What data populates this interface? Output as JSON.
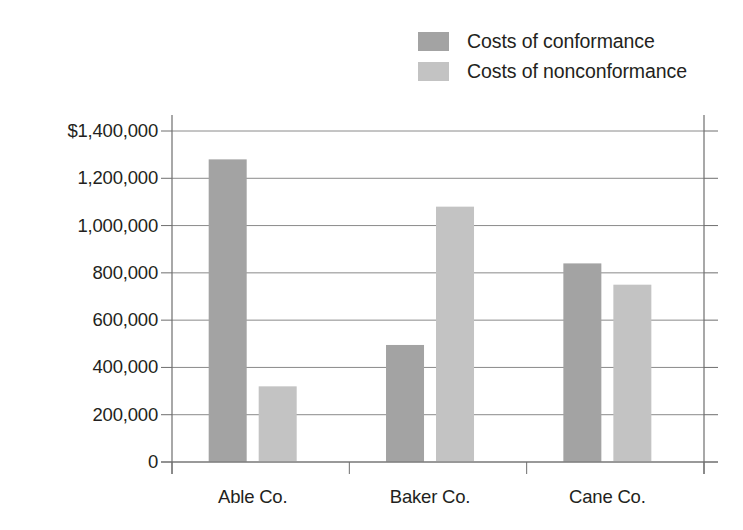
{
  "chart_data": {
    "type": "bar",
    "title": "",
    "xlabel": "",
    "ylabel": "Costs of Quality",
    "categories": [
      "Able Co.",
      "Baker Co.",
      "Cane Co."
    ],
    "series": [
      {
        "name": "Costs of conformance",
        "values": [
          1280000,
          495000,
          840000
        ],
        "color": "#a3a3a3"
      },
      {
        "name": "Costs of nonconformance",
        "values": [
          320000,
          1080000,
          750000
        ],
        "color": "#c3c3c3"
      }
    ],
    "ylim": [
      0,
      1400000
    ],
    "ytick_values": [
      1400000,
      1200000,
      1000000,
      800000,
      600000,
      400000,
      200000,
      0
    ],
    "ytick_labels": [
      "$1,400,000",
      "1,200,000",
      "1,000,000",
      "800,000",
      "600,000",
      "400,000",
      "200,000",
      "0"
    ],
    "grid": true,
    "legend_position": "top-right"
  },
  "legend": {
    "items": [
      {
        "label": "Costs of conformance",
        "color": "#a3a3a3"
      },
      {
        "label": "Costs of nonconformance",
        "color": "#c3c3c3"
      }
    ]
  },
  "axes": {
    "y_title": "Costs of Quality"
  },
  "colors": {
    "conformance": "#a3a3a3",
    "nonconformance": "#c3c3c3",
    "axis": "#6e6e6e",
    "grid": "#8a8a8a",
    "text": "#231f20"
  }
}
